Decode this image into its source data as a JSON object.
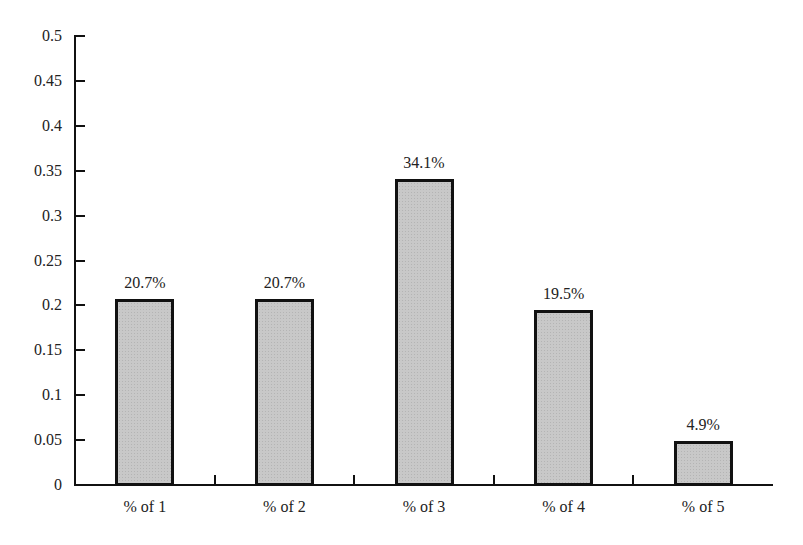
{
  "chart_data": {
    "type": "bar",
    "title": "",
    "xlabel": "",
    "ylabel": "",
    "categories": [
      "% of 1",
      "% of 2",
      "% of 3",
      "% of 4",
      "% of 5"
    ],
    "values": [
      0.207,
      0.207,
      0.341,
      0.195,
      0.049
    ],
    "data_labels": [
      "20.7%",
      "20.7%",
      "34.1%",
      "19.5%",
      "4.9%"
    ],
    "ylim": [
      0,
      0.5
    ],
    "yticks": [
      "0",
      "0.05",
      "0.1",
      "0.15",
      "0.2",
      "0.25",
      "0.3",
      "0.35",
      "0.4",
      "0.45",
      "0.5"
    ],
    "grid": false,
    "legend": null,
    "colors": {
      "bar_fill": "#c8c8c8",
      "bar_border": "#111111",
      "axis": "#111111"
    }
  }
}
